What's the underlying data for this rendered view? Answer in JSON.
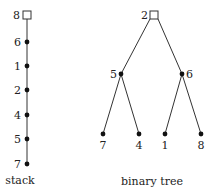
{
  "stack": {
    "caption": "stack",
    "nodes": [
      "8",
      "6",
      "1",
      "2",
      "4",
      "5",
      "7"
    ]
  },
  "tree": {
    "caption": "binary tree",
    "root": "2",
    "left": "5",
    "right": "6",
    "leaves": [
      "7",
      "4",
      "1",
      "8"
    ]
  },
  "colors": {
    "ink": "#222222",
    "background": "#ffffff"
  }
}
